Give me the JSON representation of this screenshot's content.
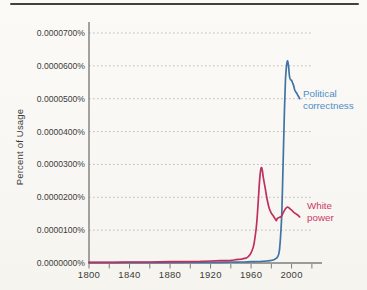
{
  "figure": {
    "background": "#faf9f6",
    "top_rule_color": "#41413f"
  },
  "chart_data": {
    "type": "line",
    "title": "",
    "xlabel": "",
    "ylabel": "Percent of Usage",
    "grid": "horizontal-dotted",
    "legend_position": "end-of-line annotations",
    "colors": {
      "grid": "#b9b8b4",
      "axis": "#7d7d7a",
      "tick_text": "#3c3c3a"
    },
    "x_axis": {
      "range_years": [
        1800,
        2030
      ],
      "tick_years": [
        1800,
        1820,
        1840,
        1860,
        1880,
        1900,
        1920,
        1940,
        1960,
        1980,
        2000,
        2020
      ],
      "labeled_years": [
        "1800",
        "1840",
        "1880",
        "1920",
        "1960",
        "2000"
      ]
    },
    "y_axis": {
      "unit": "percent",
      "ylim_percent": [
        0,
        7e-05
      ],
      "tick_labels": [
        "0.0000000%",
        "0.0000100%",
        "0.0000200%",
        "0.0000300%",
        "0.0000400%",
        "0.0000500%",
        "0.0000600%",
        "0.0000700%"
      ]
    },
    "values_unit": "1e-7 percent (615 = 0.0000615%)",
    "series": [
      {
        "name": "political-correctness",
        "label": "Political correctness",
        "color": "#3f74a6",
        "label_color": "#4e8ec5",
        "points": [
          [
            1800,
            1
          ],
          [
            1850,
            1
          ],
          [
            1900,
            2
          ],
          [
            1920,
            2
          ],
          [
            1940,
            3
          ],
          [
            1950,
            3
          ],
          [
            1960,
            4
          ],
          [
            1970,
            5
          ],
          [
            1975,
            6
          ],
          [
            1980,
            8
          ],
          [
            1983,
            11
          ],
          [
            1986,
            18
          ],
          [
            1988,
            40
          ],
          [
            1990,
            130
          ],
          [
            1991,
            230
          ],
          [
            1992,
            350
          ],
          [
            1993,
            470
          ],
          [
            1994,
            560
          ],
          [
            1995,
            600
          ],
          [
            1996,
            615
          ],
          [
            1997,
            598
          ],
          [
            1998,
            566
          ],
          [
            1999,
            558
          ],
          [
            2000,
            556
          ],
          [
            2001,
            548
          ],
          [
            2002,
            540
          ],
          [
            2003,
            528
          ],
          [
            2004,
            521
          ],
          [
            2005,
            517
          ],
          [
            2006,
            511
          ],
          [
            2007,
            506
          ],
          [
            2008,
            500
          ]
        ]
      },
      {
        "name": "white-power",
        "label": "White power",
        "color": "#bf2f5f",
        "label_color": "#cc3966",
        "points": [
          [
            1800,
            2
          ],
          [
            1820,
            2
          ],
          [
            1840,
            3
          ],
          [
            1860,
            3
          ],
          [
            1880,
            4
          ],
          [
            1900,
            4
          ],
          [
            1910,
            5
          ],
          [
            1920,
            6
          ],
          [
            1930,
            7
          ],
          [
            1940,
            8
          ],
          [
            1945,
            10
          ],
          [
            1950,
            12
          ],
          [
            1955,
            15
          ],
          [
            1957,
            19
          ],
          [
            1959,
            26
          ],
          [
            1961,
            38
          ],
          [
            1963,
            60
          ],
          [
            1965,
            105
          ],
          [
            1966,
            140
          ],
          [
            1967,
            185
          ],
          [
            1968,
            235
          ],
          [
            1969,
            272
          ],
          [
            1970,
            290
          ],
          [
            1971,
            284
          ],
          [
            1972,
            262
          ],
          [
            1974,
            226
          ],
          [
            1976,
            191
          ],
          [
            1978,
            166
          ],
          [
            1980,
            152
          ],
          [
            1982,
            143
          ],
          [
            1984,
            133
          ],
          [
            1985,
            129
          ],
          [
            1986,
            136
          ],
          [
            1988,
            139
          ],
          [
            1990,
            142
          ],
          [
            1992,
            155
          ],
          [
            1994,
            165
          ],
          [
            1996,
            170
          ],
          [
            1997,
            169
          ],
          [
            1998,
            166
          ],
          [
            2000,
            161
          ],
          [
            2002,
            155
          ],
          [
            2004,
            150
          ],
          [
            2006,
            146
          ],
          [
            2008,
            140
          ]
        ]
      }
    ]
  }
}
